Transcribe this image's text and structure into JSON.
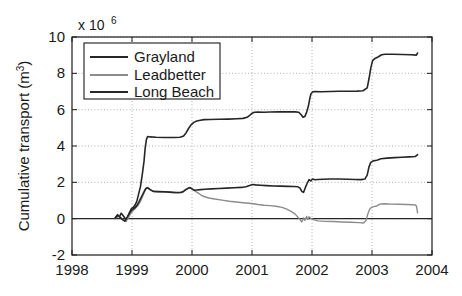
{
  "chart_data": {
    "type": "line",
    "title": "",
    "subtitle": "",
    "xlabel": "",
    "ylabel": "Cumulative transport (m",
    "ylabel_sup": "3",
    "ylabel_suffix": ")",
    "y_exponent_prefix": "x 10",
    "y_exponent_power": "6",
    "y_scale_factor": 1000000,
    "xlim": [
      1998,
      2004
    ],
    "ylim": [
      -2,
      10
    ],
    "xticks": [
      1998,
      1999,
      2000,
      2001,
      2002,
      2003,
      2004
    ],
    "xticklabels": [
      "1998",
      "1999",
      "2000",
      "2001",
      "2002",
      "2003",
      "2004"
    ],
    "yticks": [
      -2,
      0,
      2,
      4,
      6,
      8,
      10
    ],
    "yticklabels": [
      "-2",
      "0",
      "2",
      "4",
      "6",
      "8",
      "10"
    ],
    "grid": true,
    "grid_style": "dotted",
    "legend_position": "upper-left",
    "legend_entries": [
      "Grayland",
      "Leadbetter",
      "Long Beach"
    ],
    "series": [
      {
        "name": "Grayland",
        "color": "#262626",
        "linewidth": 1.6,
        "points": [
          [
            1998.72,
            0.05
          ],
          [
            1998.76,
            0.22
          ],
          [
            1998.79,
            0.1
          ],
          [
            1998.82,
            0.3
          ],
          [
            1998.85,
            0.18
          ],
          [
            1998.88,
            0.05
          ],
          [
            1998.9,
            -0.12
          ],
          [
            1998.93,
            0.1
          ],
          [
            1998.96,
            0.35
          ],
          [
            1998.99,
            0.55
          ],
          [
            1999.02,
            0.62
          ],
          [
            1999.05,
            0.75
          ],
          [
            1999.08,
            0.95
          ],
          [
            1999.11,
            1.35
          ],
          [
            1999.14,
            1.75
          ],
          [
            1999.17,
            2.4
          ],
          [
            1999.2,
            3.15
          ],
          [
            1999.22,
            3.9
          ],
          [
            1999.24,
            4.35
          ],
          [
            1999.26,
            4.52
          ],
          [
            1999.3,
            4.5
          ],
          [
            1999.4,
            4.48
          ],
          [
            1999.55,
            4.47
          ],
          [
            1999.7,
            4.47
          ],
          [
            1999.8,
            4.48
          ],
          [
            1999.86,
            4.55
          ],
          [
            1999.9,
            4.72
          ],
          [
            1999.94,
            4.95
          ],
          [
            1999.98,
            5.15
          ],
          [
            2000.03,
            5.3
          ],
          [
            2000.08,
            5.38
          ],
          [
            2000.14,
            5.42
          ],
          [
            2000.2,
            5.45
          ],
          [
            2000.3,
            5.46
          ],
          [
            2000.45,
            5.47
          ],
          [
            2000.6,
            5.48
          ],
          [
            2000.75,
            5.5
          ],
          [
            2000.85,
            5.52
          ],
          [
            2000.92,
            5.58
          ],
          [
            2000.96,
            5.68
          ],
          [
            2001.0,
            5.8
          ],
          [
            2001.04,
            5.86
          ],
          [
            2001.1,
            5.87
          ],
          [
            2001.2,
            5.86
          ],
          [
            2001.3,
            5.87
          ],
          [
            2001.45,
            5.88
          ],
          [
            2001.6,
            5.88
          ],
          [
            2001.72,
            5.88
          ],
          [
            2001.78,
            5.86
          ],
          [
            2001.82,
            5.72
          ],
          [
            2001.85,
            5.58
          ],
          [
            2001.88,
            5.62
          ],
          [
            2001.91,
            5.85
          ],
          [
            2001.94,
            6.2
          ],
          [
            2001.96,
            6.55
          ],
          [
            2001.98,
            6.85
          ],
          [
            2002.01,
            6.98
          ],
          [
            2002.05,
            7.0
          ],
          [
            2002.15,
            6.99
          ],
          [
            2002.3,
            7.0
          ],
          [
            2002.45,
            7.01
          ],
          [
            2002.6,
            7.01
          ],
          [
            2002.75,
            7.02
          ],
          [
            2002.85,
            7.04
          ],
          [
            2002.92,
            7.2
          ],
          [
            2002.95,
            7.7
          ],
          [
            2002.98,
            8.3
          ],
          [
            2003.01,
            8.7
          ],
          [
            2003.05,
            8.82
          ],
          [
            2003.1,
            8.9
          ],
          [
            2003.16,
            9.02
          ],
          [
            2003.22,
            9.05
          ],
          [
            2003.35,
            9.05
          ],
          [
            2003.5,
            9.04
          ],
          [
            2003.65,
            9.02
          ],
          [
            2003.74,
            9.0
          ],
          [
            2003.76,
            9.12
          ]
        ]
      },
      {
        "name": "Leadbetter",
        "color": "#8c8c8c",
        "linewidth": 1.4,
        "points": [
          [
            1998.72,
            0.02
          ],
          [
            1998.78,
            0.15
          ],
          [
            1998.82,
            0.05
          ],
          [
            1998.86,
            -0.08
          ],
          [
            1998.9,
            -0.15
          ],
          [
            1998.94,
            0.05
          ],
          [
            1998.98,
            0.3
          ],
          [
            1999.02,
            0.45
          ],
          [
            1999.06,
            0.58
          ],
          [
            1999.1,
            0.72
          ],
          [
            1999.14,
            0.95
          ],
          [
            1999.18,
            1.25
          ],
          [
            1999.21,
            1.5
          ],
          [
            1999.24,
            1.68
          ],
          [
            1999.27,
            1.72
          ],
          [
            1999.3,
            1.62
          ],
          [
            1999.35,
            1.5
          ],
          [
            1999.42,
            1.48
          ],
          [
            1999.5,
            1.47
          ],
          [
            1999.6,
            1.45
          ],
          [
            1999.7,
            1.43
          ],
          [
            1999.78,
            1.42
          ],
          [
            1999.84,
            1.48
          ],
          [
            1999.88,
            1.58
          ],
          [
            1999.92,
            1.66
          ],
          [
            1999.96,
            1.7
          ],
          [
            2000.0,
            1.64
          ],
          [
            2000.05,
            1.52
          ],
          [
            2000.1,
            1.42
          ],
          [
            2000.15,
            1.3
          ],
          [
            2000.2,
            1.22
          ],
          [
            2000.28,
            1.14
          ],
          [
            2000.38,
            1.08
          ],
          [
            2000.5,
            1.02
          ],
          [
            2000.62,
            0.96
          ],
          [
            2000.74,
            0.92
          ],
          [
            2000.85,
            0.88
          ],
          [
            2000.95,
            0.85
          ],
          [
            2001.02,
            0.82
          ],
          [
            2001.1,
            0.78
          ],
          [
            2001.2,
            0.74
          ],
          [
            2001.3,
            0.72
          ],
          [
            2001.4,
            0.68
          ],
          [
            2001.5,
            0.62
          ],
          [
            2001.58,
            0.52
          ],
          [
            2001.65,
            0.4
          ],
          [
            2001.72,
            0.25
          ],
          [
            2001.76,
            0.1
          ],
          [
            2001.8,
            -0.05
          ],
          [
            2001.83,
            -0.18
          ],
          [
            2001.86,
            0.05
          ],
          [
            2001.88,
            -0.1
          ],
          [
            2001.91,
            0.12
          ],
          [
            2001.93,
            -0.05
          ],
          [
            2001.95,
            0.1
          ],
          [
            2001.98,
            0.02
          ],
          [
            2002.02,
            -0.05
          ],
          [
            2002.1,
            -0.12
          ],
          [
            2002.2,
            -0.15
          ],
          [
            2002.35,
            -0.16
          ],
          [
            2002.5,
            -0.18
          ],
          [
            2002.65,
            -0.2
          ],
          [
            2002.78,
            -0.22
          ],
          [
            2002.86,
            -0.24
          ],
          [
            2002.9,
            -0.1
          ],
          [
            2002.93,
            0.25
          ],
          [
            2002.96,
            0.52
          ],
          [
            2002.99,
            0.62
          ],
          [
            2003.03,
            0.66
          ],
          [
            2003.08,
            0.7
          ],
          [
            2003.13,
            0.8
          ],
          [
            2003.2,
            0.82
          ],
          [
            2003.32,
            0.8
          ],
          [
            2003.45,
            0.79
          ],
          [
            2003.58,
            0.78
          ],
          [
            2003.68,
            0.77
          ],
          [
            2003.72,
            0.76
          ],
          [
            2003.74,
            0.7
          ],
          [
            2003.76,
            0.32
          ]
        ]
      },
      {
        "name": "Long Beach",
        "color": "#262626",
        "linewidth": 1.6,
        "points": [
          [
            1998.72,
            0.02
          ],
          [
            1998.76,
            0.18
          ],
          [
            1998.8,
            0.08
          ],
          [
            1998.84,
            -0.05
          ],
          [
            1998.88,
            -0.14
          ],
          [
            1998.92,
            0.08
          ],
          [
            1998.96,
            0.32
          ],
          [
            1999.0,
            0.48
          ],
          [
            1999.04,
            0.58
          ],
          [
            1999.08,
            0.72
          ],
          [
            1999.12,
            0.95
          ],
          [
            1999.16,
            1.22
          ],
          [
            1999.2,
            1.48
          ],
          [
            1999.23,
            1.66
          ],
          [
            1999.26,
            1.7
          ],
          [
            1999.3,
            1.6
          ],
          [
            1999.36,
            1.5
          ],
          [
            1999.44,
            1.49
          ],
          [
            1999.54,
            1.48
          ],
          [
            1999.64,
            1.46
          ],
          [
            1999.74,
            1.44
          ],
          [
            1999.82,
            1.44
          ],
          [
            1999.86,
            1.5
          ],
          [
            1999.9,
            1.6
          ],
          [
            1999.94,
            1.68
          ],
          [
            1999.97,
            1.71
          ],
          [
            2000.0,
            1.64
          ],
          [
            2000.04,
            1.56
          ],
          [
            2000.08,
            1.58
          ],
          [
            2000.14,
            1.6
          ],
          [
            2000.22,
            1.62
          ],
          [
            2000.32,
            1.64
          ],
          [
            2000.45,
            1.66
          ],
          [
            2000.58,
            1.68
          ],
          [
            2000.7,
            1.7
          ],
          [
            2000.82,
            1.72
          ],
          [
            2000.9,
            1.76
          ],
          [
            2000.96,
            1.82
          ],
          [
            2001.01,
            1.88
          ],
          [
            2001.06,
            1.86
          ],
          [
            2001.14,
            1.84
          ],
          [
            2001.24,
            1.82
          ],
          [
            2001.36,
            1.8
          ],
          [
            2001.48,
            1.79
          ],
          [
            2001.6,
            1.78
          ],
          [
            2001.7,
            1.77
          ],
          [
            2001.76,
            1.76
          ],
          [
            2001.8,
            1.68
          ],
          [
            2001.83,
            1.5
          ],
          [
            2001.86,
            1.45
          ],
          [
            2001.89,
            1.72
          ],
          [
            2001.92,
            1.95
          ],
          [
            2001.95,
            2.15
          ],
          [
            2001.98,
            2.08
          ],
          [
            2002.01,
            2.18
          ],
          [
            2002.05,
            2.14
          ],
          [
            2002.1,
            2.16
          ],
          [
            2002.18,
            2.17
          ],
          [
            2002.3,
            2.18
          ],
          [
            2002.45,
            2.18
          ],
          [
            2002.6,
            2.17
          ],
          [
            2002.72,
            2.16
          ],
          [
            2002.82,
            2.15
          ],
          [
            2002.88,
            2.18
          ],
          [
            2002.92,
            2.4
          ],
          [
            2002.95,
            2.85
          ],
          [
            2002.98,
            3.1
          ],
          [
            2003.02,
            3.18
          ],
          [
            2003.08,
            3.22
          ],
          [
            2003.15,
            3.3
          ],
          [
            2003.25,
            3.33
          ],
          [
            2003.38,
            3.36
          ],
          [
            2003.5,
            3.38
          ],
          [
            2003.62,
            3.4
          ],
          [
            2003.72,
            3.42
          ],
          [
            2003.76,
            3.52
          ]
        ]
      }
    ],
    "zero_line": {
      "y": 0,
      "color": "#262626"
    }
  },
  "figure": {
    "background_color": "#ffffff",
    "axes_color": "#1a1a1a",
    "grid_color": "#9a9a9a"
  }
}
